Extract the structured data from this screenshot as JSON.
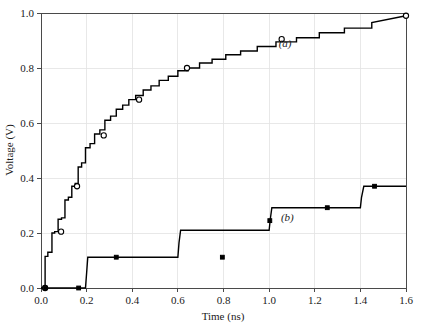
{
  "chart_data": {
    "type": "line",
    "title": "",
    "subtitle": "",
    "xlabel": "Time (ns)",
    "ylabel": "Voltage (V)",
    "xlim": [
      0.0,
      1.6
    ],
    "ylim": [
      0.0,
      1.0
    ],
    "xticks": [
      "0.0",
      "0.2",
      "0.4",
      "0.6",
      "0.8",
      "1.0",
      "1.2",
      "1.4",
      "1.6"
    ],
    "xtick_values": [
      0.0,
      0.2,
      0.4,
      0.6,
      0.8,
      1.0,
      1.2,
      1.4,
      1.6
    ],
    "yticks": [
      "0.0",
      "0.2",
      "0.4",
      "0.6",
      "0.8",
      "1.0"
    ],
    "ytick_values": [
      0.0,
      0.2,
      0.4,
      0.6,
      0.8,
      1.0
    ],
    "grid": true,
    "grid_color": "#e2e2e2",
    "legend_position": "inline-annotations",
    "annotations": [
      {
        "text": "(a)",
        "x": 1.07,
        "y": 0.875
      },
      {
        "text": "(b)",
        "x": 1.08,
        "y": 0.245
      }
    ],
    "series": [
      {
        "name": "(a)",
        "style": "staircase",
        "color": "#000000",
        "marker": "open-circle",
        "x": [
          0.0,
          0.018,
          0.018,
          0.03,
          0.03,
          0.048,
          0.048,
          0.06,
          0.06,
          0.075,
          0.075,
          0.09,
          0.09,
          0.105,
          0.105,
          0.12,
          0.12,
          0.135,
          0.135,
          0.15,
          0.15,
          0.163,
          0.163,
          0.178,
          0.178,
          0.195,
          0.195,
          0.215,
          0.215,
          0.235,
          0.235,
          0.258,
          0.258,
          0.28,
          0.28,
          0.305,
          0.305,
          0.33,
          0.33,
          0.358,
          0.358,
          0.385,
          0.385,
          0.415,
          0.415,
          0.448,
          0.448,
          0.482,
          0.482,
          0.518,
          0.518,
          0.558,
          0.558,
          0.6,
          0.6,
          0.645,
          0.645,
          0.695,
          0.695,
          0.75,
          0.75,
          0.81,
          0.81,
          0.875,
          0.875,
          0.948,
          0.948,
          1.03,
          1.03,
          1.12,
          1.12,
          1.22,
          1.22,
          1.33,
          1.33,
          1.45,
          1.45,
          1.6
        ],
        "y": [
          0.0,
          0.0,
          0.115,
          0.115,
          0.13,
          0.13,
          0.2,
          0.2,
          0.205,
          0.205,
          0.25,
          0.25,
          0.255,
          0.255,
          0.32,
          0.32,
          0.33,
          0.33,
          0.37,
          0.37,
          0.38,
          0.38,
          0.44,
          0.44,
          0.455,
          0.455,
          0.51,
          0.51,
          0.525,
          0.525,
          0.56,
          0.56,
          0.575,
          0.575,
          0.61,
          0.61,
          0.625,
          0.625,
          0.65,
          0.65,
          0.665,
          0.665,
          0.685,
          0.685,
          0.7,
          0.7,
          0.72,
          0.72,
          0.735,
          0.735,
          0.755,
          0.755,
          0.77,
          0.77,
          0.79,
          0.79,
          0.8,
          0.8,
          0.818,
          0.818,
          0.832,
          0.832,
          0.848,
          0.848,
          0.862,
          0.862,
          0.878,
          0.878,
          0.895,
          0.895,
          0.91,
          0.91,
          0.928,
          0.928,
          0.945,
          0.945,
          0.965,
          0.99
        ],
        "markers": [
          {
            "x": 0.018,
            "y": 0.0
          },
          {
            "x": 0.088,
            "y": 0.205
          },
          {
            "x": 0.158,
            "y": 0.37
          },
          {
            "x": 0.275,
            "y": 0.555
          },
          {
            "x": 0.43,
            "y": 0.685
          },
          {
            "x": 0.64,
            "y": 0.8
          },
          {
            "x": 1.055,
            "y": 0.905
          },
          {
            "x": 1.6,
            "y": 0.99
          }
        ]
      },
      {
        "name": "(b)",
        "style": "staircase",
        "color": "#000000",
        "marker": "filled-square",
        "x": [
          0.0,
          0.195,
          0.2,
          0.205,
          0.6,
          0.605,
          0.612,
          1.0,
          1.005,
          1.012,
          1.4,
          1.405,
          1.415,
          1.6
        ],
        "y": [
          0.0,
          0.0,
          0.055,
          0.112,
          0.112,
          0.165,
          0.21,
          0.21,
          0.25,
          0.292,
          0.292,
          0.33,
          0.37,
          0.37
        ],
        "markers": [
          {
            "x": 0.018,
            "y": 0.0
          },
          {
            "x": 0.165,
            "y": 0.0
          },
          {
            "x": 0.33,
            "y": 0.112
          },
          {
            "x": 0.795,
            "y": 0.112
          },
          {
            "x": 1.003,
            "y": 0.245
          },
          {
            "x": 1.255,
            "y": 0.292
          },
          {
            "x": 1.462,
            "y": 0.37
          }
        ]
      }
    ]
  }
}
